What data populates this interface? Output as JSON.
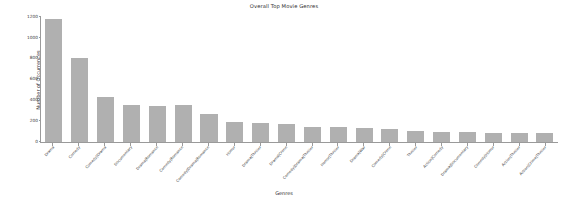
{
  "chart_data": {
    "type": "bar",
    "title": "Overall Top Movie Genres",
    "xlabel": "Genres",
    "ylabel": "Number of Occurrences",
    "ylim": [
      0,
      1200
    ],
    "yticks": [
      0,
      200,
      400,
      600,
      800,
      1000,
      1200
    ],
    "grid": false,
    "legend": null,
    "bar_color": "#b0b0b0",
    "categories": [
      "Drama",
      "Comedy",
      "Comedy|Drama",
      "Documentary",
      "Drama|Romance",
      "Comedy|Romance",
      "Comedy|Drama|Romance",
      "Horror",
      "Drama|Thriller",
      "Drama|Crime",
      "Comedy|Drama|Thriller",
      "Horror|Thriller",
      "Drama|War",
      "Comedy|Crime",
      "Thriller",
      "Action|Comedy",
      "Drama|Documentary",
      "Comedy|Horror",
      "Action|Thriller",
      "Action|Crime|Thriller"
    ],
    "values": [
      1180,
      810,
      430,
      360,
      350,
      355,
      270,
      190,
      185,
      175,
      145,
      140,
      135,
      125,
      105,
      100,
      95,
      90,
      88,
      85
    ]
  }
}
